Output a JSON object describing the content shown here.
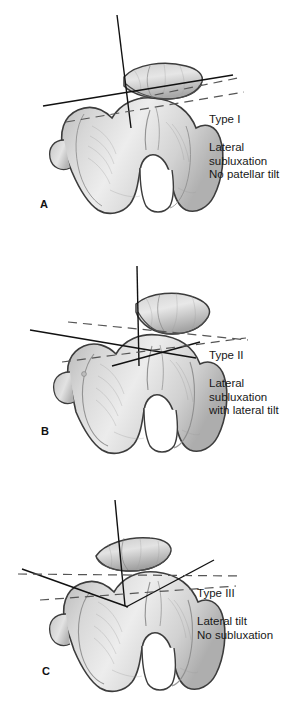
{
  "figure": {
    "kind": "medical-illustration",
    "background_color": "#ffffff",
    "ink_color": "#181818",
    "bone_fill_light": "#e9e9e9",
    "bone_fill_mid": "#cfcfcf",
    "bone_fill_dark": "#a8a8a8",
    "bone_outline": "#3a3a3a",
    "line_color": "#111111",
    "dash_color": "#555555"
  },
  "panels": [
    {
      "id": "a",
      "letter": "A",
      "type_label": "Type I",
      "description_lines": [
        "Lateral",
        "subluxation",
        "No patellar tilt"
      ]
    },
    {
      "id": "b",
      "letter": "B",
      "type_label": "Type II",
      "description_lines": [
        "Lateral",
        "subluxation",
        "with lateral tilt"
      ]
    },
    {
      "id": "c",
      "letter": "C",
      "type_label": "Type III",
      "description_lines": [
        "Lateral tilt",
        "No subluxation"
      ]
    }
  ]
}
